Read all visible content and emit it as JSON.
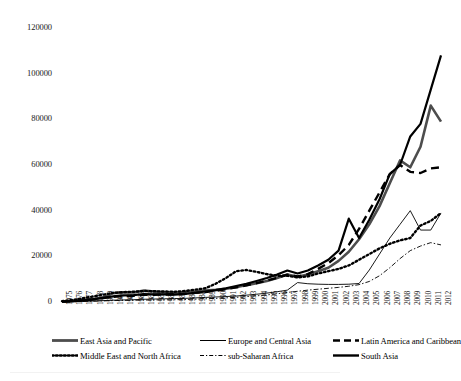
{
  "chart_data": {
    "type": "line",
    "title": "",
    "subtitle": "",
    "xlabel": "",
    "ylabel": "",
    "grid": false,
    "legend_position": "bottom",
    "ylim": [
      0,
      120000
    ],
    "ytick_labels": [
      "0",
      "20000",
      "40000",
      "60000",
      "80000",
      "100000",
      "120000"
    ],
    "ytick_values": [
      0,
      20000,
      40000,
      60000,
      80000,
      100000,
      120000
    ],
    "categories": [
      "1975",
      "1976",
      "1977",
      "1978",
      "1979",
      "1980",
      "1981",
      "1982",
      "1983",
      "1984",
      "1985",
      "1986",
      "1987",
      "1988",
      "1989",
      "1990",
      "1991",
      "1992",
      "1993",
      "1994",
      "1995",
      "1996",
      "1997",
      "1998",
      "1999",
      "2000",
      "2001",
      "2002",
      "2003",
      "2004",
      "2005",
      "2006",
      "2007",
      "2008",
      "2009",
      "2010",
      "2011",
      "2012"
    ],
    "series": [
      {
        "name": "East Asia and Pacific",
        "style": "solid-thick-gray",
        "color": "#4d4d4d",
        "width": 2.6,
        "dash": "none",
        "values": [
          150,
          400,
          800,
          1300,
          2000,
          3900,
          4300,
          4200,
          5000,
          4600,
          4200,
          4000,
          4200,
          4600,
          5000,
          5300,
          5800,
          6500,
          7400,
          8200,
          9200,
          10500,
          12000,
          11000,
          12000,
          13500,
          15000,
          18000,
          22000,
          27500,
          34000,
          42000,
          52000,
          62000,
          59000,
          68000,
          86000,
          79000
        ]
      },
      {
        "name": "Europe and Central Asia",
        "style": "solid-thin",
        "color": "#000000",
        "width": 0.9,
        "dash": "none",
        "values": [
          100,
          200,
          300,
          400,
          600,
          800,
          900,
          1000,
          1200,
          1300,
          1400,
          1500,
          1600,
          1800,
          2000,
          2200,
          2400,
          2600,
          3000,
          3400,
          3900,
          4500,
          5200,
          8500,
          8000,
          7800,
          7700,
          7700,
          7800,
          8100,
          14000,
          21000,
          28000,
          34000,
          40000,
          31500,
          31500,
          39000
        ]
      },
      {
        "name": "Latin America and Caribbean",
        "style": "dashed-thick",
        "color": "#000000",
        "width": 2.4,
        "dash": "8,5",
        "values": [
          150,
          350,
          700,
          1100,
          1700,
          2300,
          2600,
          2700,
          3100,
          3200,
          3300,
          3400,
          3600,
          4000,
          4400,
          4900,
          5600,
          6400,
          7300,
          8300,
          9400,
          10600,
          12000,
          11200,
          12200,
          14500,
          17000,
          20500,
          25000,
          32000,
          40000,
          48000,
          56000,
          60000,
          57000,
          56500,
          58500,
          59000
        ]
      },
      {
        "name": "Middle East and North Africa",
        "style": "dotted-thick",
        "color": "#000000",
        "width": 2.4,
        "dash": "1.6,2.6",
        "values": [
          400,
          900,
          1600,
          2400,
          3200,
          4000,
          4300,
          4500,
          4800,
          4700,
          4600,
          4500,
          4800,
          5400,
          6000,
          8000,
          10500,
          13500,
          14000,
          13200,
          12200,
          11500,
          11500,
          10800,
          11200,
          12500,
          13500,
          14500,
          16000,
          18500,
          21000,
          23500,
          25500,
          27000,
          28000,
          33500,
          35500,
          39000
        ]
      },
      {
        "name": "sub-Saharan Africa",
        "style": "dash-dot-thin",
        "color": "#000000",
        "width": 0.9,
        "dash": "5,2,1.5,2",
        "values": [
          80,
          160,
          250,
          350,
          480,
          620,
          700,
          760,
          850,
          900,
          950,
          1000,
          1100,
          1250,
          1400,
          1600,
          1800,
          2050,
          2350,
          2700,
          3100,
          3600,
          4200,
          4700,
          5200,
          5600,
          6000,
          6400,
          6900,
          7600,
          9000,
          11500,
          15000,
          19000,
          22500,
          24500,
          26000,
          25000
        ]
      },
      {
        "name": "South Asia",
        "style": "solid-thick-black",
        "color": "#000000",
        "width": 2.2,
        "dash": "none",
        "values": [
          120,
          320,
          680,
          1150,
          1800,
          2500,
          2900,
          3000,
          3500,
          3400,
          3300,
          3200,
          3500,
          4000,
          4600,
          5200,
          6000,
          7000,
          8000,
          9200,
          10500,
          12000,
          13800,
          12500,
          13800,
          16000,
          18500,
          22500,
          36500,
          28000,
          36000,
          45000,
          56000,
          60000,
          72500,
          78000,
          93000,
          108000
        ]
      }
    ]
  },
  "axes": {
    "y_min_label": "0",
    "y_max_label": "120000"
  },
  "legend": {
    "rows": [
      [
        {
          "label": "East Asia and Pacific",
          "swatch": "solid-thick-gray"
        },
        {
          "label": "Europe and Central Asia",
          "swatch": "solid-thin"
        },
        {
          "label": "Latin America and Caribbean",
          "swatch": "dashed-thick"
        }
      ],
      [
        {
          "label": "Middle East and North Africa",
          "swatch": "dotted-thick"
        },
        {
          "label": "sub-Saharan Africa",
          "swatch": "dash-dot-thin"
        },
        {
          "label": "South Asia",
          "swatch": "solid-thick-black"
        }
      ]
    ]
  }
}
